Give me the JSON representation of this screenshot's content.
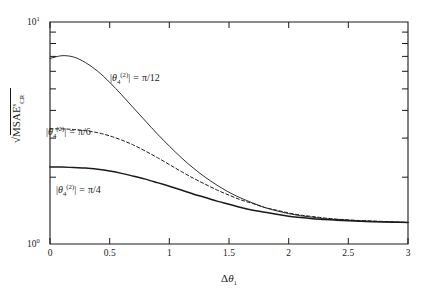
{
  "figure": {
    "background": "#ffffff",
    "ink_color": "#1a1a1a"
  },
  "axes": {
    "y_label_parts": {
      "radical": "√",
      "base": "MSAE",
      "superscript": "s",
      "subscript": "CR"
    },
    "x_label_parts": {
      "delta": "Δ",
      "theta": "θ",
      "subscript": "1"
    },
    "x_ticks": [
      "0",
      "0.5",
      "1",
      "1.5",
      "2",
      "2.5",
      "3"
    ],
    "y_tick_labels": [
      {
        "mantissa": "10",
        "exponent": "1"
      },
      {
        "mantissa": "10",
        "exponent": "0"
      }
    ]
  },
  "annotations": [
    {
      "id": "annot-pi-12",
      "abs_open": "|",
      "theta": "θ",
      "sub": "4",
      "sup": "(2)",
      "abs_close": "|",
      "equals": "=",
      "value": "π/12"
    },
    {
      "id": "annot-pi-6",
      "abs_open": "|",
      "theta": "θ",
      "sub": "4",
      "sup": "(2)",
      "abs_close": "|",
      "equals": "=",
      "value": "π/6"
    },
    {
      "id": "annot-pi-4",
      "abs_open": "|",
      "theta": "θ",
      "sub": "4",
      "sup": "(2)",
      "abs_close": "|",
      "equals": "=",
      "value": "π/4"
    }
  ],
  "chart_data": {
    "type": "line",
    "title": "",
    "xlabel": "Δθ₁",
    "ylabel": "sqrt(MSAE^s_CR)",
    "xlim": [
      0,
      3
    ],
    "ylim": [
      1,
      10
    ],
    "yscale": "log",
    "xscale": "linear",
    "grid": false,
    "legend": "inline-annotations",
    "x_ticks": [
      0,
      0.5,
      1,
      1.5,
      2,
      2.5,
      3
    ],
    "y_major_ticks": [
      1,
      10
    ],
    "y_minor_ticks": [
      2,
      3,
      4,
      5,
      6,
      7,
      8,
      9
    ],
    "x": [
      0,
      0.1,
      0.2,
      0.3,
      0.4,
      0.5,
      0.6,
      0.7,
      0.8,
      0.9,
      1.0,
      1.1,
      1.2,
      1.3,
      1.4,
      1.5,
      1.6,
      1.7,
      1.8,
      1.9,
      2.0,
      2.1,
      2.2,
      2.3,
      2.4,
      2.5,
      2.6,
      2.7,
      2.8,
      2.9,
      3.0
    ],
    "series": [
      {
        "name": "|theta_4^(2)| = pi/12",
        "style": "solid-thin",
        "values": [
          6.85,
          7.05,
          6.95,
          6.55,
          6.0,
          5.35,
          4.7,
          4.1,
          3.58,
          3.13,
          2.76,
          2.45,
          2.2,
          2.0,
          1.84,
          1.71,
          1.61,
          1.53,
          1.46,
          1.41,
          1.37,
          1.34,
          1.32,
          1.3,
          1.29,
          1.28,
          1.27,
          1.265,
          1.26,
          1.255,
          1.25
        ]
      },
      {
        "name": "|theta_4^(2)| = pi/6",
        "style": "dashed",
        "values": [
          3.3,
          3.3,
          3.28,
          3.24,
          3.17,
          3.07,
          2.94,
          2.79,
          2.62,
          2.45,
          2.28,
          2.12,
          1.98,
          1.86,
          1.75,
          1.66,
          1.58,
          1.52,
          1.46,
          1.42,
          1.38,
          1.35,
          1.33,
          1.31,
          1.295,
          1.285,
          1.275,
          1.27,
          1.263,
          1.256,
          1.25
        ]
      },
      {
        "name": "|theta_4^(2)| = pi/4",
        "style": "solid-thick",
        "values": [
          2.22,
          2.22,
          2.21,
          2.2,
          2.17,
          2.13,
          2.08,
          2.02,
          1.96,
          1.89,
          1.82,
          1.75,
          1.68,
          1.62,
          1.56,
          1.51,
          1.46,
          1.42,
          1.39,
          1.36,
          1.335,
          1.315,
          1.3,
          1.29,
          1.28,
          1.272,
          1.265,
          1.26,
          1.256,
          1.253,
          1.25
        ]
      }
    ],
    "annotation_positions": [
      {
        "label": "|theta_4^(2)| = pi/12",
        "x": 0.62,
        "y": 4.6
      },
      {
        "label": "|theta_4^(2)| = pi/6",
        "x": 0.04,
        "y": 3.65
      },
      {
        "label": "|theta_4^(2)| = pi/4",
        "x": 0.14,
        "y": 1.88
      }
    ]
  }
}
